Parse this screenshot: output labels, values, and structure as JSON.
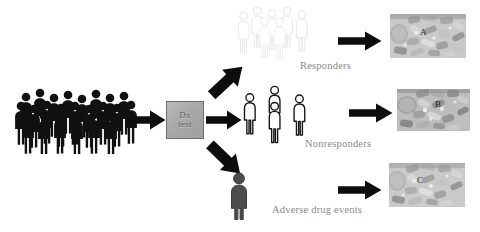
{
  "figure": {
    "background_color": "#ffffff"
  },
  "population": {
    "name": "patient-population-crowd",
    "figure_count": 22,
    "fill_color": "#111111"
  },
  "dx_test": {
    "line1": "Dx",
    "line2": "test",
    "box_fill": "#aaaaaa",
    "border_color": "#6e6e6e",
    "text_color": "#5d5d5d"
  },
  "branches": [
    {
      "id": "responders",
      "label": "Responders",
      "group_figure_count": 5,
      "group_fill": "#ffffff",
      "group_stroke": "#e8e8e8",
      "arrow_direction": "up-right"
    },
    {
      "id": "nonresponders",
      "label": "Nonresponders",
      "group_figure_count": 4,
      "group_fill": "#ffffff",
      "group_stroke": "#1a1a1a",
      "arrow_direction": "right"
    },
    {
      "id": "adverse-drug-events",
      "label": "Adverse drug events",
      "group_figure_count": 1,
      "group_fill": "#4a4a4a",
      "group_stroke": "#3a3a3a",
      "arrow_direction": "down-right"
    }
  ],
  "panels": [
    {
      "id": "panel-a",
      "letter": "A",
      "kind": "micrograph",
      "tone": "light-gray"
    },
    {
      "id": "panel-b",
      "letter": "B",
      "kind": "micrograph",
      "tone": "mid-gray"
    },
    {
      "id": "panel-c",
      "letter": "C",
      "kind": "micrograph",
      "tone": "light-gray"
    }
  ],
  "arrows": {
    "population_to_dx": "right",
    "dx_to_responders": "up-right",
    "dx_to_nonresponders": "right",
    "dx_to_adverse": "down-right",
    "responders_to_panel_a": "right",
    "nonresponders_to_panel_b": "right",
    "adverse_to_panel_c": "right",
    "color": "#0d0d0d"
  },
  "label_color": "#8a8a8a"
}
